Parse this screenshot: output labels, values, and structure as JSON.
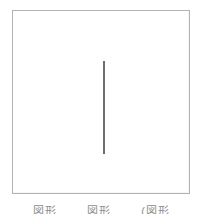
{
  "figure": {
    "kind": "line-drawing",
    "background_color": "#ffffff",
    "frame": {
      "label": "figure-frame",
      "border_color": "#b2b2b2",
      "border_width_px": 1,
      "x": 12,
      "y": 10,
      "width": 178,
      "height": 184
    },
    "marks": [
      {
        "name": "vertical-stroke",
        "type": "line",
        "orientation": "vertical",
        "color": "#6e6e6e",
        "thickness_px": 2,
        "x": 104,
        "y_start": 61,
        "y_end": 154,
        "length_px": 93
      }
    ]
  },
  "caption": {
    "visible": true,
    "clipped": true,
    "note": "caption text is cut off by the bottom edge of the image; only the tops of the glyphs are rendered",
    "color": "#8d8d8d",
    "segments": [
      {
        "text": "図形"
      },
      {
        "text": "図形"
      },
      {
        "text": "(図形"
      }
    ]
  }
}
